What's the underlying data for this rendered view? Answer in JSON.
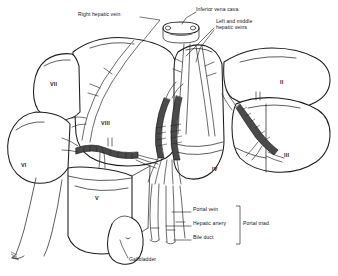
{
  "figure": {
    "background_color": "#ffffff",
    "ink_color": "#1a1a1a"
  },
  "labels": [
    {
      "id": "right-hepatic-vein",
      "text": "Right hepatic vein",
      "x": 78,
      "y": 14
    },
    {
      "id": "inferior-vena-cava",
      "text": "Inferior vena cava",
      "x": 196,
      "y": 9
    },
    {
      "id": "left-and-middle-hepatic-veins",
      "text": "Left and middle\nhepatic veins",
      "x": 216,
      "y": 21
    },
    {
      "id": "portal-vein",
      "text": "Portal vein",
      "x": 193,
      "y": 209
    },
    {
      "id": "hepatic-artery",
      "text": "Hepatic artery",
      "x": 193,
      "y": 223
    },
    {
      "id": "bile-duct",
      "text": "Bile duct",
      "x": 193,
      "y": 237
    },
    {
      "id": "portal-triad",
      "text": "Portal triad",
      "x": 243,
      "y": 223
    },
    {
      "id": "gallbladder",
      "text": "Gallbladder",
      "x": 129,
      "y": 259
    }
  ],
  "segments": [
    {
      "id": "segment-vii",
      "numeral": "VII",
      "x": 50,
      "y": 84
    },
    {
      "id": "segment-vi",
      "numeral": "VI",
      "x": 21,
      "y": 165
    },
    {
      "id": "segment-viii",
      "numeral": "VIII",
      "x": 101,
      "y": 123
    },
    {
      "id": "segment-v",
      "numeral": "V",
      "x": 95,
      "y": 198
    },
    {
      "id": "segment-iv",
      "numeral": "IV",
      "x": 212,
      "y": 169
    },
    {
      "id": "segment-ii",
      "numeral": "II",
      "x": 280,
      "y": 82
    },
    {
      "id": "segment-iii",
      "numeral": "III",
      "x": 284,
      "y": 155
    }
  ]
}
